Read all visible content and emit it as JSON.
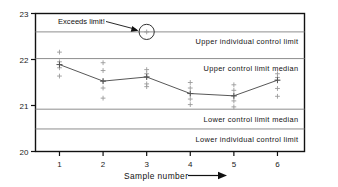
{
  "chart_data": {
    "type": "line",
    "title": "",
    "xlabel": "Sample number",
    "ylabel": "",
    "xlim": [
      0.45,
      6.62
    ],
    "ylim": [
      20,
      23
    ],
    "grid": false,
    "legend": "none",
    "x": [
      1,
      2,
      3,
      4,
      5,
      6
    ],
    "categories": [
      "1",
      "2",
      "3",
      "4",
      "5",
      "6"
    ],
    "y_ticks": [
      "20",
      "21",
      "22",
      "23"
    ],
    "y_tick_values": [
      20,
      21,
      22,
      23
    ],
    "series": [
      {
        "name": "Sample median",
        "values": [
          21.89,
          21.53,
          21.62,
          21.26,
          21.21,
          21.55
        ]
      }
    ],
    "individuals": [
      {
        "sample": 1,
        "values": [
          22.16,
          21.95,
          21.89,
          21.82,
          21.64
        ]
      },
      {
        "sample": 2,
        "values": [
          21.93,
          21.76,
          21.53,
          21.38,
          21.16
        ]
      },
      {
        "sample": 3,
        "values": [
          22.6,
          21.78,
          21.69,
          21.62,
          21.47,
          21.41
        ]
      },
      {
        "sample": 4,
        "values": [
          21.5,
          21.38,
          21.26,
          21.14,
          21.02
        ]
      },
      {
        "sample": 5,
        "values": [
          21.45,
          21.33,
          21.21,
          21.1,
          20.97
        ]
      },
      {
        "sample": 6,
        "values": [
          21.69,
          21.61,
          21.55,
          21.37,
          21.2
        ]
      }
    ],
    "control_limits": [
      {
        "name": "Upper individual control limit",
        "value": 22.6,
        "label": "Upper individual  control limit"
      },
      {
        "name": "Upper control limit median",
        "value": 22.02,
        "label": "Upper  control  limit  median"
      },
      {
        "name": "Lower control limit median",
        "value": 20.92,
        "label": "Lower  control  limit  median"
      },
      {
        "name": "Lower individual control limit",
        "value": 20.49,
        "label": "Lower individual  control  limit"
      }
    ],
    "annotations": [
      {
        "text": "Exceeds limit!",
        "points_to_sample": 3,
        "points_to_value": 22.6,
        "marker": "circle"
      }
    ]
  },
  "axis": {
    "x_caption": "Sample number",
    "x_arrow": "arrow-right"
  }
}
